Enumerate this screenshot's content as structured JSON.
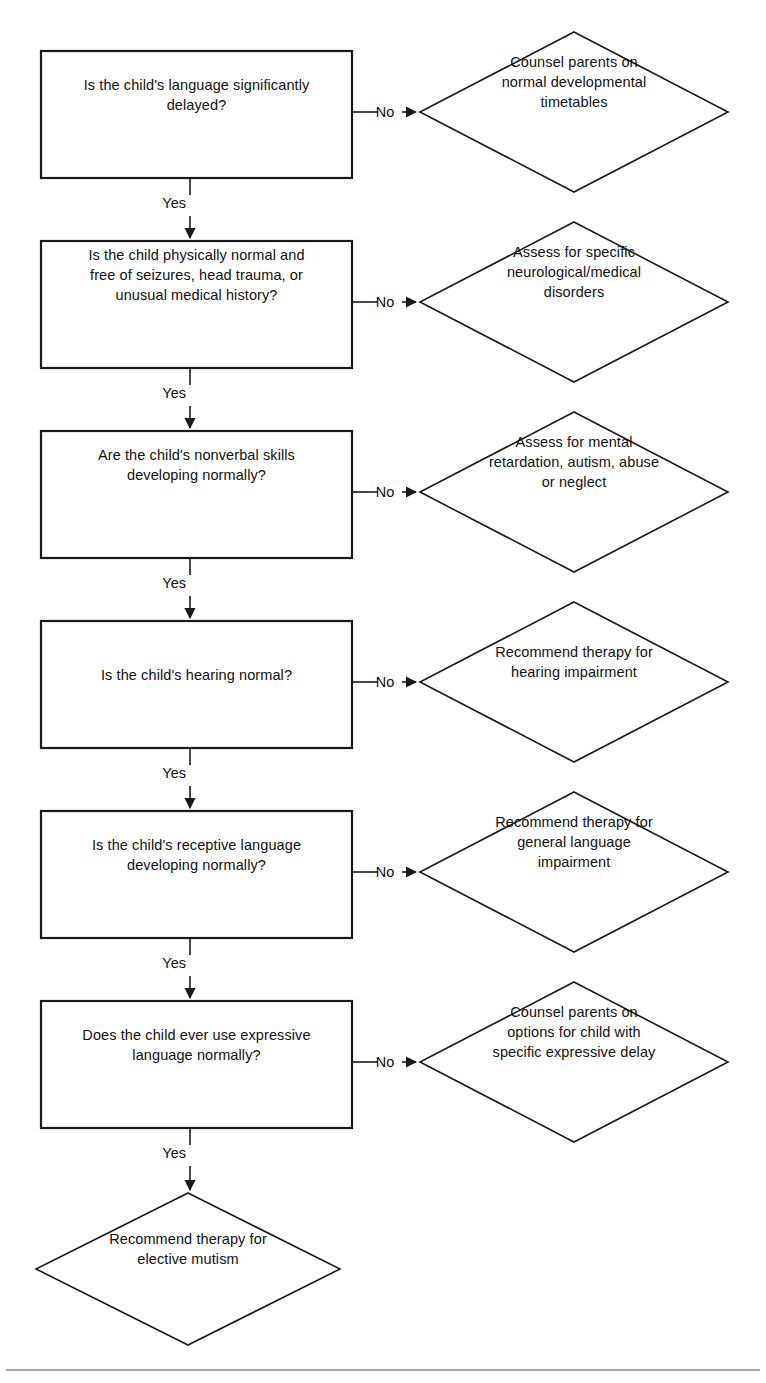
{
  "diagram": {
    "title_visible": false,
    "type": "flowchart",
    "orientation": "top-to-bottom",
    "line_color": "#1a1a1a",
    "text_color": "#111111",
    "background": "#ffffff",
    "footer_rule": true,
    "yes_label": "Yes",
    "no_label": "No",
    "questions": [
      {
        "id": "q1",
        "text": "Is the child's language significantly\ndelayed?",
        "box": {
          "x": 41,
          "y": 51,
          "w": 311,
          "h": 127
        }
      },
      {
        "id": "q2",
        "text": "Is the child physically normal and\nfree of seizures, head trauma, or\nunusual medical history?",
        "box": {
          "x": 41,
          "y": 241,
          "w": 311,
          "h": 127
        }
      },
      {
        "id": "q3",
        "text": "Are the child's nonverbal skills\ndeveloping normally?",
        "box": {
          "x": 41,
          "y": 431,
          "w": 311,
          "h": 127
        }
      },
      {
        "id": "q4",
        "text": "Is the child's hearing normal?",
        "box": {
          "x": 41,
          "y": 621,
          "w": 311,
          "h": 127
        }
      },
      {
        "id": "q5",
        "text": "Is the child's receptive language\ndeveloping normally?",
        "box": {
          "x": 41,
          "y": 811,
          "w": 311,
          "h": 127
        }
      },
      {
        "id": "q6",
        "text": "Does the child ever use expressive\nlanguage normally?",
        "box": {
          "x": 41,
          "y": 1001,
          "w": 311,
          "h": 127
        }
      }
    ],
    "outcomes": [
      {
        "id": "o1",
        "text": "Counsel parents on\nnormal developmental\ntimetables",
        "diamond": {
          "cx": 574,
          "cy": 112,
          "rx": 154,
          "ry": 80
        }
      },
      {
        "id": "o2",
        "text": "Assess for specific\nneurological/medical\ndisorders",
        "diamond": {
          "cx": 574,
          "cy": 302,
          "rx": 154,
          "ry": 80
        }
      },
      {
        "id": "o3",
        "text": "Assess for mental\nretardation, autism, abuse\nor neglect",
        "diamond": {
          "cx": 574,
          "cy": 492,
          "rx": 154,
          "ry": 80
        }
      },
      {
        "id": "o4",
        "text": "Recommend therapy for\nhearing impairment",
        "diamond": {
          "cx": 574,
          "cy": 682,
          "rx": 154,
          "ry": 80
        }
      },
      {
        "id": "o5",
        "text": "Recommend therapy for\ngeneral language\nimpairment",
        "diamond": {
          "cx": 574,
          "cy": 872,
          "rx": 154,
          "ry": 80
        }
      },
      {
        "id": "o6",
        "text": "Counsel parents on\noptions for child with\nspecific expressive delay",
        "diamond": {
          "cx": 574,
          "cy": 1062,
          "rx": 154,
          "ry": 80
        }
      }
    ],
    "final": {
      "id": "final",
      "text": "Recommend therapy for\nelective mutism",
      "diamond": {
        "cx": 188,
        "cy": 1269,
        "rx": 152,
        "ry": 76
      }
    },
    "edges": [
      {
        "from": "q1",
        "to": "o1",
        "label": "No",
        "direction": "right"
      },
      {
        "from": "q1",
        "to": "q2",
        "label": "Yes",
        "direction": "down"
      },
      {
        "from": "q2",
        "to": "o2",
        "label": "No",
        "direction": "right"
      },
      {
        "from": "q2",
        "to": "q3",
        "label": "Yes",
        "direction": "down"
      },
      {
        "from": "q3",
        "to": "o3",
        "label": "No",
        "direction": "right"
      },
      {
        "from": "q3",
        "to": "q4",
        "label": "Yes",
        "direction": "down"
      },
      {
        "from": "q4",
        "to": "o4",
        "label": "No",
        "direction": "right"
      },
      {
        "from": "q4",
        "to": "q5",
        "label": "Yes",
        "direction": "down"
      },
      {
        "from": "q5",
        "to": "o5",
        "label": "No",
        "direction": "right"
      },
      {
        "from": "q5",
        "to": "q6",
        "label": "Yes",
        "direction": "down"
      },
      {
        "from": "q6",
        "to": "o6",
        "label": "No",
        "direction": "right"
      },
      {
        "from": "q6",
        "to": "final",
        "label": "Yes",
        "direction": "down"
      }
    ]
  }
}
